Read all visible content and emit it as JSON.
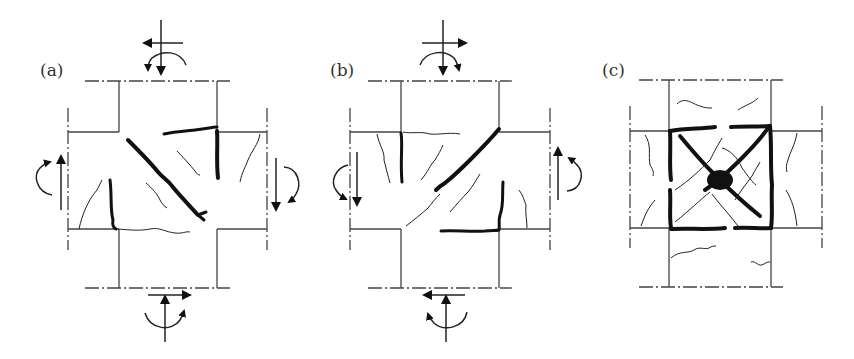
{
  "figure": {
    "panels": [
      {
        "id": "a",
        "label": "(a)",
        "description": "Diagonal cracking from one loading direction, with flexural cracks at beam-column interfaces"
      },
      {
        "id": "b",
        "label": "(b)",
        "description": "Diagonal cracking from the reversed loading direction"
      },
      {
        "id": "c",
        "label": "(c)",
        "description": "X-shaped crossing diagonal cracks in joint core with heavy boundary cracking after cyclic loading"
      }
    ]
  },
  "colors": {
    "line": "#444444",
    "crack": "#111111",
    "background": "#ffffff"
  }
}
